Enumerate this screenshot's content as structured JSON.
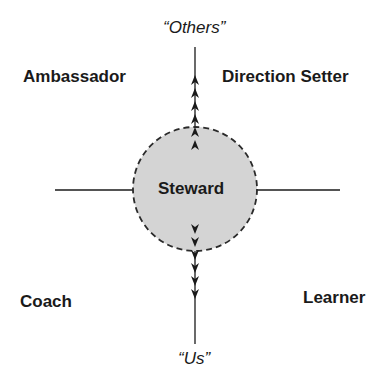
{
  "diagram": {
    "center_label": "Steward",
    "axis_top": "“Others”",
    "axis_bottom": "“Us”",
    "quadrants": {
      "top_left": "Ambassador",
      "top_right": "Direction Setter",
      "bottom_left": "Coach",
      "bottom_right": "Learner"
    },
    "colors": {
      "circle_fill": "#d4d4d4",
      "stroke": "#1a1a1a",
      "background": "#ffffff"
    }
  }
}
